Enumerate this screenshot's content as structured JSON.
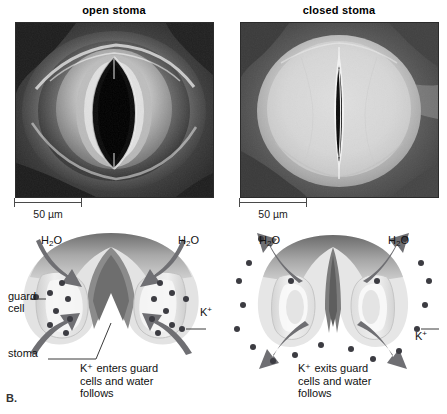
{
  "figure": {
    "panel_letter": "B.",
    "scale_bar_label": "50 µm",
    "scale_bar_value": 50,
    "scale_bar_unit": "µm"
  },
  "panels": {
    "open": {
      "title": "open stoma",
      "micrograph_alt": "scanning electron micrograph of an open stoma",
      "scale_label": "50 µm",
      "labels": {
        "water_left": "H2O",
        "water_right": "H2O",
        "guard_cell": "guard\ncell",
        "stoma": "stoma",
        "potassium": "K+"
      },
      "caption": "K⁺ enters guard\ncells and water\nfollows"
    },
    "closed": {
      "title": "closed stoma",
      "micrograph_alt": "scanning electron micrograph of a closed stoma",
      "scale_label": "50 µm",
      "labels": {
        "water_left": "H2O",
        "water_right": "H2O",
        "potassium": "K+"
      },
      "caption": "K⁺ exits guard\ncells and water\nfollows"
    }
  },
  "colors": {
    "background": "#ffffff",
    "text": "#111111",
    "arrow_gray": "#6f6f73",
    "cell_light": "#e9e9e9",
    "cell_mid": "#b9b9b9",
    "cell_dark": "#7a7a7a",
    "ion_dot": "#3c3c42",
    "border": "#2b2b2b",
    "scalebar": "#4a4a4a"
  }
}
